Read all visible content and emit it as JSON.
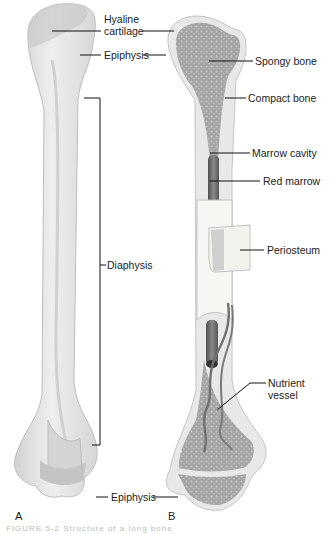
{
  "figure": {
    "panels": [
      {
        "id": "A",
        "label": "A",
        "description": "external view of long bone"
      },
      {
        "id": "B",
        "label": "B",
        "description": "longitudinal section of long bone"
      }
    ],
    "labels": {
      "hyaline_line1": "Hyaline",
      "hyaline_line2": "cartilage",
      "epiphysis_top": "Epiphysis",
      "diaphysis": "Diaphysis",
      "epiphysis_bottom": "Epiphysis",
      "spongy_bone": "Spongy bone",
      "compact_bone": "Compact bone",
      "marrow_cavity": "Marrow cavity",
      "red_marrow": "Red marrow",
      "periosteum": "Periosteum",
      "nutrient_line1": "Nutrient",
      "nutrient_line2": "vessel"
    },
    "caption": "FIGURE 5-2 Structure of a long bone"
  },
  "colors": {
    "bone_outer": "#e6e6e6",
    "bone_shade": "#cfcfcf",
    "spongy": "#9a9a9a",
    "compact": "#ececec",
    "marrow": "#6f6f6f",
    "periosteum": "#f4f4f0",
    "vessel": "#7a7a7a",
    "leader": "#111111"
  }
}
